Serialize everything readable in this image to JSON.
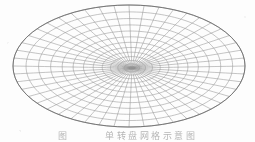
{
  "figure": {
    "kind": "elliptical-polar-mesh",
    "line_color": "#8c8c8c",
    "outline_color": "#6f6f6f",
    "background_color": "#fdfdfd",
    "ellipse": {
      "center_x": 129,
      "center_y": 66,
      "radius_x": 116,
      "radius_y": 61
    },
    "focus": {
      "x": 132,
      "y": 68
    },
    "mesh": {
      "radial_spokes": 48,
      "concentric_rings": 13,
      "ring_label": "concentric elliptical rings",
      "spoke_label": "radial spokes"
    }
  },
  "caption": {
    "prefix": "图",
    "gap": " ",
    "text": "单转盘网格示意图"
  }
}
